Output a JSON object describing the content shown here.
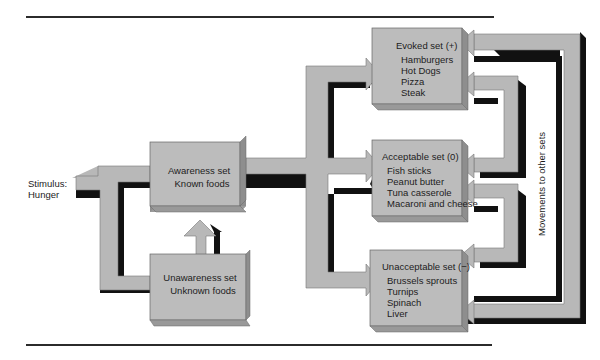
{
  "diagram": {
    "stimulus": {
      "line1": "Stimulus:",
      "line2": "Hunger"
    },
    "awareness_set": {
      "title": "Awareness set",
      "subtitle": "Known foods"
    },
    "unawareness_set": {
      "title": "Unawareness set",
      "subtitle": "Unknown foods"
    },
    "evoked_set": {
      "title": "Evoked set (+)",
      "items": [
        "Hamburgers",
        "Hot Dogs",
        "Pizza",
        "Steak"
      ]
    },
    "acceptable_set": {
      "title": "Acceptable set (0)",
      "items": [
        "Fish sticks",
        "Peanut butter",
        "Tuna casserole",
        "Macaroni and cheese"
      ]
    },
    "unacceptable_set": {
      "title": "Unacceptable set (−)",
      "items": [
        "Brussels sprouts",
        "Turnips",
        "Spinach",
        "Liver"
      ]
    },
    "movements_label": "Movements to other sets"
  },
  "colors": {
    "box_fill": "#bcbcbc",
    "box_side": "#8e8e8e",
    "arrow_fill": "#b8b8b8",
    "shadow": "#111111",
    "rule": "#2b2b2b"
  }
}
